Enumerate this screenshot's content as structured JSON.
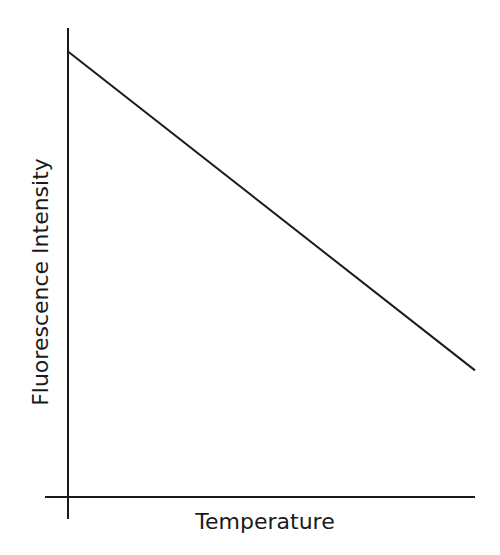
{
  "chart_data": {
    "type": "line",
    "title": "",
    "xlabel": "Temperature",
    "ylabel": "Fluorescence Intensity",
    "grid": false,
    "legend": null,
    "xlim": [
      0,
      1
    ],
    "ylim": [
      0,
      1
    ],
    "x_ticks": [],
    "y_ticks": [],
    "series": [
      {
        "name": "Fluorescence vs Temperature",
        "x": [
          0,
          1
        ],
        "y": [
          0.95,
          0.27
        ]
      }
    ],
    "annotations": []
  },
  "colors": {
    "line": "#1a1a1a",
    "axis": "#1a1a1a",
    "background": "#ffffff"
  }
}
